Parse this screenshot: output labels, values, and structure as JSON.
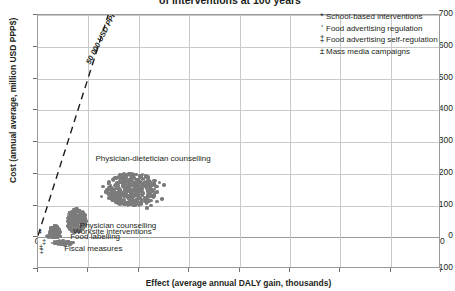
{
  "chart_data": {
    "type": "scatter",
    "title": "of interventions at 100 years",
    "xlabel": "Effect (average annual DALY gain, thousands)",
    "ylabel": "Cost (annual average, million USD PPP$)",
    "xlim": [
      0,
      80
    ],
    "ylim": [
      -100,
      700
    ],
    "xticks": [
      0,
      10,
      20,
      30,
      40,
      50,
      60,
      70,
      80
    ],
    "yticks": [
      -100,
      0,
      100,
      200,
      300,
      400,
      500,
      600,
      700
    ],
    "grid": true,
    "legend_position": "top-right",
    "marker_color": "#7b7b7b",
    "legend": [
      {
        "symbol": "*",
        "label": "School-based interventions"
      },
      {
        "symbol": "'",
        "label": "Food advertising regulation"
      },
      {
        "symbol": "‡",
        "label": "Food advertising self-regulation"
      },
      {
        "symbol": "±",
        "label": "Mass media campaigns"
      }
    ],
    "annotations": [
      {
        "name": "threshold",
        "text": "50 000 USD PPP$/DALY",
        "x0": 0,
        "y0": 0,
        "x1": 14.6,
        "y1": 730
      }
    ],
    "point_labels": [
      {
        "text": "Physician-dietetician counselling",
        "x": 11.4,
        "y": 247
      },
      {
        "text": "Physician counselling",
        "x": 8.3,
        "y": 36
      },
      {
        "text": "Worksite interventions",
        "x": 7.0,
        "y": 18
      },
      {
        "text": "Food labelling",
        "x": 6.4,
        "y": 2
      },
      {
        "text": "Fiscal measures",
        "x": 5.2,
        "y": -38
      }
    ],
    "clusters": [
      {
        "name": "Physician-dietetician counselling",
        "cx": 18.6,
        "cy": 150,
        "rx": 5.2,
        "ry": 52,
        "n": 460,
        "seed": 17,
        "r_min": 1.1,
        "r_max": 2.0
      },
      {
        "name": "Physician counselling",
        "cx": 7.6,
        "cy": 52,
        "rx": 2.1,
        "ry": 38,
        "n": 250,
        "seed": 53,
        "r_min": 1.0,
        "r_max": 1.9
      },
      {
        "name": "Worksite interventions",
        "cx": 3.3,
        "cy": 18,
        "rx": 1.1,
        "ry": 20,
        "n": 110,
        "seed": 91,
        "r_min": 0.9,
        "r_max": 1.7
      },
      {
        "name": "Food labelling",
        "cx": 3.1,
        "cy": 3,
        "rx": 1.5,
        "ry": 6,
        "n": 70,
        "seed": 131,
        "r_min": 0.9,
        "r_max": 1.6
      },
      {
        "name": "Fiscal measures",
        "cx": 5.0,
        "cy": -18,
        "rx": 2.4,
        "ry": 7,
        "n": 90,
        "seed": 167,
        "r_min": 0.9,
        "r_max": 1.7
      }
    ],
    "outliers": [
      {
        "x": 23.2,
        "y": 178
      },
      {
        "x": 24.1,
        "y": 172
      },
      {
        "x": 25.0,
        "y": 164
      },
      {
        "x": 24.6,
        "y": 120
      },
      {
        "x": 23.6,
        "y": 112
      },
      {
        "x": 22.4,
        "y": 100
      },
      {
        "x": 21.6,
        "y": 92
      },
      {
        "x": 12.9,
        "y": 160
      },
      {
        "x": 13.4,
        "y": 143
      },
      {
        "x": 12.6,
        "y": 128
      }
    ],
    "symbol_markers": [
      {
        "symbol": "*",
        "x": 0.55,
        "y": 18
      },
      {
        "symbol": "*",
        "x": 0.55,
        "y": 10
      },
      {
        "symbol": "‡",
        "x": 1.2,
        "y": -14
      },
      {
        "symbol": "±",
        "x": 0.6,
        "y": -32
      },
      {
        "symbol": "‡",
        "x": 0.7,
        "y": -42
      }
    ]
  }
}
